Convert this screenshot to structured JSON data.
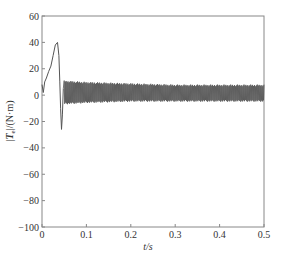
{
  "chart_data": {
    "type": "line",
    "title": "",
    "xlabel": "t/s",
    "ylabel": "|Te|/(N·m)",
    "ylabel_parts": {
      "prefix": "|",
      "symbol": "T",
      "subscript": "e",
      "suffix": "|/(N·m)"
    },
    "xlim": [
      0,
      0.5
    ],
    "ylim": [
      -100,
      60
    ],
    "xticks": [
      0,
      0.1,
      0.2,
      0.3,
      0.4,
      0.5
    ],
    "xtick_labels": [
      "0",
      "0.1",
      "0.2",
      "0.3",
      "0.4",
      "0.5"
    ],
    "yticks": [
      60,
      40,
      20,
      0,
      -20,
      -40,
      -60,
      -80,
      -100
    ],
    "ytick_labels": [
      "60",
      "40",
      "20",
      "0",
      "−20",
      "−40",
      "−60",
      "−80",
      "−100"
    ],
    "grid": false,
    "legend": null,
    "series": [
      {
        "name": "Te",
        "color": "#555555",
        "startup_transient": {
          "x": [
            0.0,
            0.003,
            0.006,
            0.01,
            0.015,
            0.02,
            0.025,
            0.03,
            0.035,
            0.038,
            0.04,
            0.042,
            0.044,
            0.046,
            0.048
          ],
          "y": [
            8,
            2,
            10,
            13,
            18,
            22,
            30,
            38,
            40,
            30,
            10,
            -10,
            -26,
            -15,
            5
          ]
        },
        "steady_oscillation": {
          "x_range": [
            0.05,
            0.5
          ],
          "upper_envelope": {
            "x": [
              0.05,
              0.1,
              0.2,
              0.3,
              0.4,
              0.5
            ],
            "y": [
              11,
              10,
              9,
              8,
              8,
              8
            ]
          },
          "lower_envelope": {
            "x": [
              0.05,
              0.1,
              0.2,
              0.3,
              0.4,
              0.5
            ],
            "y": [
              -7,
              -6,
              -5,
              -5,
              -5,
              -5
            ]
          }
        }
      }
    ]
  }
}
